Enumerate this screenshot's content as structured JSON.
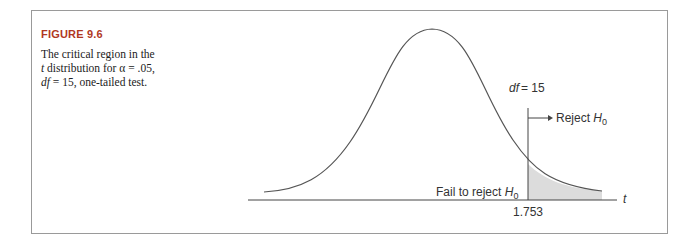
{
  "figure": {
    "label": "FIGURE 9.6",
    "caption_line1": "The critical region in the",
    "caption_line2_var": "t",
    "caption_line2_rest": " distribution for α = .05,",
    "caption_line3_var": "df",
    "caption_line3_rest": " = 15, one-tailed test."
  },
  "diagram": {
    "df_label": "df",
    "df_value": "= 15",
    "reject_label": "Reject",
    "fail_label": "Fail to reject",
    "hyp_symbol": "H",
    "hyp_sub": "0",
    "axis_var": "t",
    "critical_value": "1.753",
    "title_color": "#b0381f",
    "shade_color": "#dcdcdc"
  }
}
